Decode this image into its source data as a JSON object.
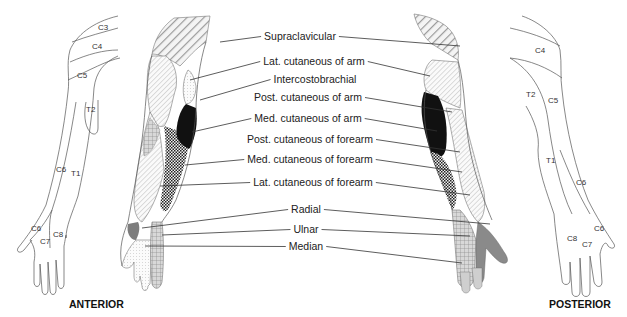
{
  "figure": {
    "views": {
      "anterior": "ANTERIOR",
      "posterior": "POSTERIOR"
    },
    "nerve_labels": [
      {
        "id": "supraclavicular",
        "text": "Supraclavicular",
        "x": 300,
        "y": 40,
        "left_to": [
          220,
          42
        ],
        "right_to": [
          460,
          46
        ]
      },
      {
        "id": "lat-cut-arm",
        "text": "Lat. cutaneous of arm",
        "x": 314,
        "y": 65,
        "left_to": [
          190,
          80
        ],
        "right_to": [
          430,
          76
        ]
      },
      {
        "id": "intercostobrachial",
        "text": "Intercostobrachial",
        "x": 315,
        "y": 83,
        "left_to": [
          200,
          100
        ],
        "right_to": null
      },
      {
        "id": "post-cut-arm",
        "text": "Post. cutaneous of arm",
        "x": 308,
        "y": 101,
        "left_to": null,
        "right_to": [
          452,
          112
        ]
      },
      {
        "id": "med-cut-arm",
        "text": "Med. cutaneous of arm",
        "x": 308,
        "y": 122,
        "left_to": [
          192,
          132
        ],
        "right_to": [
          437,
          131
        ]
      },
      {
        "id": "post-cut-forearm",
        "text": "Post. cutaneous of forearm",
        "x": 310,
        "y": 143,
        "left_to": null,
        "right_to": [
          460,
          152
        ]
      },
      {
        "id": "med-cut-forearm",
        "text": "Med. cutaneous of forearm",
        "x": 310,
        "y": 163,
        "left_to": [
          185,
          165
        ],
        "right_to": [
          462,
          172
        ]
      },
      {
        "id": "lat-cut-forearm",
        "text": "Lat. cutaneous of forearm",
        "x": 313,
        "y": 186,
        "left_to": [
          160,
          186
        ],
        "right_to": [
          470,
          195
        ]
      },
      {
        "id": "radial",
        "text": "Radial",
        "x": 306,
        "y": 213,
        "left_to": [
          142,
          228
        ],
        "right_to": [
          490,
          224
        ]
      },
      {
        "id": "ulnar",
        "text": "Ulnar",
        "x": 306,
        "y": 233,
        "left_to": [
          162,
          235
        ],
        "right_to": [
          470,
          236
        ]
      },
      {
        "id": "median",
        "text": "Median",
        "x": 306,
        "y": 250,
        "left_to": [
          145,
          246
        ],
        "right_to": [
          462,
          263
        ]
      }
    ],
    "anterior_dermatomes": [
      {
        "text": "C3",
        "x": 98,
        "y": 30
      },
      {
        "text": "C4",
        "x": 92,
        "y": 49
      },
      {
        "text": "C5",
        "x": 77,
        "y": 78
      },
      {
        "text": "T2",
        "x": 86,
        "y": 112
      },
      {
        "text": "C6",
        "x": 60,
        "y": 172
      },
      {
        "text": "T1",
        "x": 75,
        "y": 175
      },
      {
        "text": "C6",
        "x": 36,
        "y": 231
      },
      {
        "text": "C8",
        "x": 56,
        "y": 237
      },
      {
        "text": "C7",
        "x": 43,
        "y": 244
      }
    ],
    "posterior_dermatomes": [
      {
        "text": "C4",
        "x": 538,
        "y": 53
      },
      {
        "text": "T2",
        "x": 528,
        "y": 96
      },
      {
        "text": "C5",
        "x": 549,
        "y": 101
      },
      {
        "text": "T1",
        "x": 549,
        "y": 162
      },
      {
        "text": "C6",
        "x": 580,
        "y": 185
      },
      {
        "text": "C6",
        "x": 594,
        "y": 231
      },
      {
        "text": "C8",
        "x": 570,
        "y": 241
      },
      {
        "text": "C7",
        "x": 585,
        "y": 247
      }
    ],
    "colors": {
      "background": "#ffffff",
      "text": "#222222",
      "outline": "#555555",
      "dark_region": "#111111",
      "radial_fill": "#8a8a8a",
      "hatch": "#9a9a9a"
    }
  }
}
